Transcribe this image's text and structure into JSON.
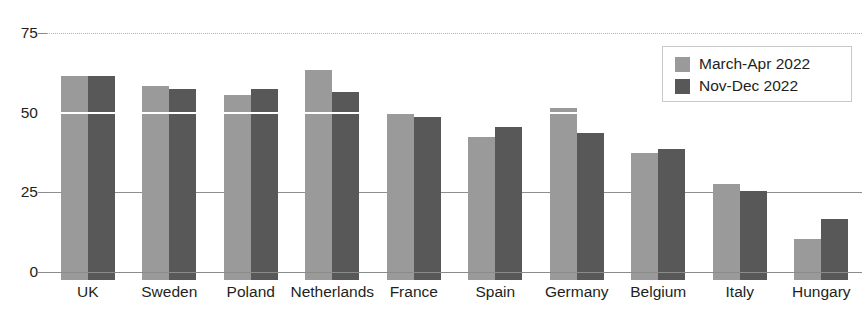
{
  "chart_data": {
    "type": "bar",
    "title": "",
    "xlabel": "",
    "ylabel": "",
    "ylim": [
      0,
      75
    ],
    "yticks": [
      0,
      25,
      50,
      75
    ],
    "grid": true,
    "legend_position": "top-right",
    "categories": [
      "UK",
      "Sweden",
      "Poland",
      "Netherlands",
      "France",
      "Spain",
      "Germany",
      "Belgium",
      "Italy",
      "Hungary"
    ],
    "series": [
      {
        "name": "March-Apr 2022",
        "color": "#9a9a9a",
        "values": [
          64,
          61,
          58,
          66,
          52,
          45,
          54,
          40,
          30,
          13
        ]
      },
      {
        "name": "Nov-Dec 2022",
        "color": "#585858",
        "values": [
          64,
          60,
          60,
          59,
          51,
          48,
          46,
          41,
          28,
          19
        ]
      }
    ]
  },
  "axis": {
    "y_tick_labels": [
      "75",
      "50",
      "25",
      "0"
    ]
  },
  "legend": {
    "items": [
      {
        "label": "March-Apr 2022",
        "color": "#9a9a9a"
      },
      {
        "label": "Nov-Dec 2022",
        "color": "#585858"
      }
    ]
  },
  "title_remnant": {
    "text": ""
  }
}
